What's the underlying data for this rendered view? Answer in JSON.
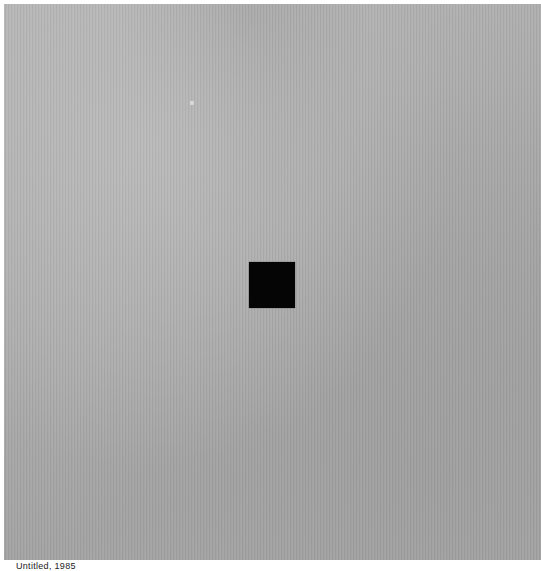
{
  "artwork": {
    "description": "Gray textured panel with small black square near center",
    "background_color": "#aaaaaa",
    "square_color": "#050505"
  },
  "caption": {
    "text": "Untitled, 1985"
  }
}
